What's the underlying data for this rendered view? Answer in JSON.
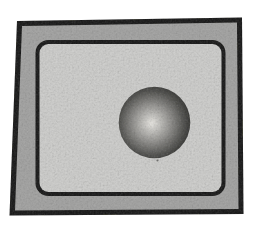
{
  "illustration": {
    "name": "shaded-ball-inside-framed-panel",
    "colors": {
      "page_background": "#ffffff",
      "frame_fill": "#a4a4a3",
      "frame_border": "#151514",
      "panel_fill": "#d0d0ce",
      "panel_border": "#151514",
      "ball_highlight": "#eceae5",
      "ball_light": "#c6c5c1",
      "ball_mid": "#8e8d8a",
      "ball_dark": "#4e4e4b",
      "ball_edge": "#232321"
    }
  }
}
